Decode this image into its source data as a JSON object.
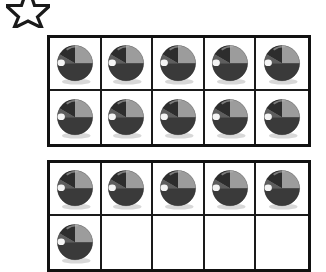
{
  "page": {
    "background_color": "#ffffff",
    "worksheet_type": "ten-frame counting worksheet"
  },
  "decoration": {
    "star": {
      "icon": "star-icon",
      "label": "star",
      "fill_color": "#ffffff",
      "outline_color": "#1a1a1a",
      "cropped": "top portion cut off by page edge"
    }
  },
  "frames": [
    {
      "name": "ten-frame-1",
      "rows": 2,
      "columns": 5,
      "filled_count": 10,
      "cells": [
        {
          "filled": true
        },
        {
          "filled": true
        },
        {
          "filled": true
        },
        {
          "filled": true
        },
        {
          "filled": true
        },
        {
          "filled": true
        },
        {
          "filled": true
        },
        {
          "filled": true
        },
        {
          "filled": true
        },
        {
          "filled": true
        }
      ]
    },
    {
      "name": "ten-frame-2",
      "rows": 2,
      "columns": 5,
      "filled_count": 6,
      "cells": [
        {
          "filled": true
        },
        {
          "filled": true
        },
        {
          "filled": true
        },
        {
          "filled": true
        },
        {
          "filled": true
        },
        {
          "filled": true
        },
        {
          "filled": false
        },
        {
          "filled": false
        },
        {
          "filled": false
        },
        {
          "filled": false
        }
      ]
    }
  ],
  "counter": {
    "icon": "beach-ball-icon",
    "label": "beach ball",
    "colors": {
      "dark_segment": "#2b2b2b",
      "mid_segment": "#6e6e6e",
      "light_segment": "#9a9a9a",
      "highlight": "#f2f2f2",
      "shadow": "#d4d4d4"
    }
  },
  "border": {
    "outer_color": "#111111",
    "inner_color": "#1a1a1a"
  }
}
